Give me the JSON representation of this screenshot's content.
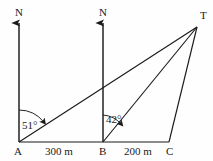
{
  "figure": {
    "background_color": "#fefefe",
    "stroke_color": "#1a1a1a",
    "points": {
      "A": {
        "label": "A",
        "x": 19,
        "y": 142
      },
      "B": {
        "label": "B",
        "x": 103,
        "y": 142
      },
      "C": {
        "label": "C",
        "x": 169,
        "y": 142
      },
      "T": {
        "label": "T",
        "x": 197,
        "y": 27
      }
    },
    "north_arrows": [
      {
        "label": "N",
        "at": "A",
        "x": 19,
        "top_y": 20,
        "bottom_y": 142
      },
      {
        "label": "N",
        "at": "B",
        "x": 103,
        "top_y": 20,
        "bottom_y": 142
      }
    ],
    "angles": [
      {
        "label": "51°",
        "vertex": "A",
        "value": 51,
        "unit": "degrees",
        "from": "north",
        "to": "T"
      },
      {
        "label": "42°",
        "vertex": "B",
        "value": 42,
        "unit": "degrees",
        "from": "north",
        "to": "T"
      }
    ],
    "segments": [
      {
        "name": "baseline-A-C",
        "from": "A",
        "to": "C"
      },
      {
        "name": "line-A-T",
        "from": "A",
        "to": "T"
      },
      {
        "name": "line-B-T",
        "from": "B",
        "to": "T"
      },
      {
        "name": "line-C-T",
        "from": "C",
        "to": "T"
      }
    ],
    "distances": [
      {
        "label": "300 m",
        "value": 300,
        "unit": "m",
        "from": "A",
        "to": "B",
        "x": 45,
        "y": 147
      },
      {
        "label": "200 m",
        "value": 200,
        "unit": "m",
        "from": "B",
        "to": "C",
        "x": 124,
        "y": 147
      }
    ]
  }
}
